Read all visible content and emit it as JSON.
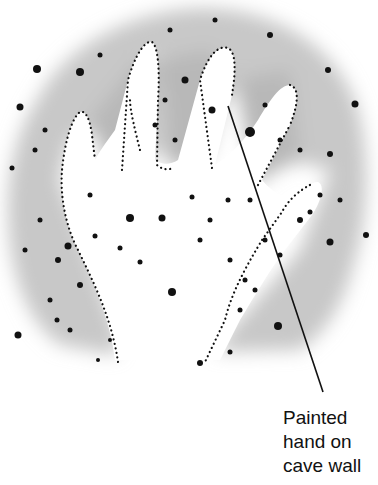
{
  "figure": {
    "background_color": "#ffffff",
    "blotch_color": "#c9c9c9",
    "dot_color": "#111111"
  },
  "callout": {
    "lines": [
      "Painted",
      "hand on",
      "cave wall"
    ]
  }
}
